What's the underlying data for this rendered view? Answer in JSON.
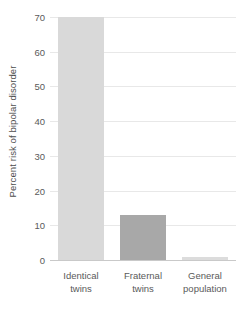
{
  "chart_data": {
    "type": "bar",
    "title": "",
    "subtitle": "",
    "xlabel": "",
    "ylabel": "Percent risk of bipolar disorder",
    "categories": [
      "Identical twins",
      "Fraternal twins",
      "General population"
    ],
    "category_lines": [
      [
        "Identical",
        "twins"
      ],
      [
        "Fraternal",
        "twins"
      ],
      [
        "General",
        "population"
      ]
    ],
    "values": [
      70,
      13,
      1
    ],
    "ylim": [
      0,
      70
    ],
    "yticks": [
      0,
      10,
      20,
      30,
      40,
      50,
      60,
      70
    ],
    "ytick_labels": [
      "0",
      "10",
      "20",
      "30",
      "40",
      "50",
      "60",
      "70"
    ],
    "grid": true,
    "grid_axis": "y",
    "legend": false,
    "legend_position": "none",
    "bar_colors": [
      "#d9d9d9",
      "#a8a8a8",
      "#dcdcdc"
    ]
  },
  "colors": {
    "background": "#ffffff",
    "gridline": "#e8e8e8",
    "baseline": "#c9c9c9",
    "tick_text": "#5a5a5a",
    "axis_title_text": "#4d4d4d"
  }
}
